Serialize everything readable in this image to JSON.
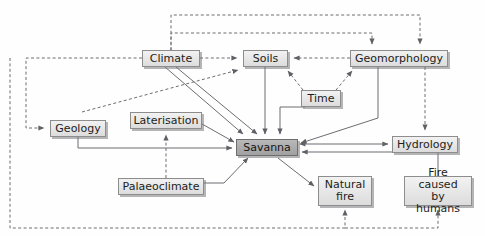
{
  "diagram": {
    "caption_sliver": "",
    "colors": {
      "node_fill": "#e6e6e6",
      "node_border": "#8d8d8d",
      "accent_fill": "#ababab",
      "accent_border": "#6e6e6e",
      "line": "#6d6d72",
      "text": "#1d1d20",
      "background": "#ffffff"
    },
    "nodes": [
      {
        "id": "climate",
        "label": "Climate",
        "x": 142,
        "y": 50,
        "w": 58,
        "h": 17,
        "accent": false
      },
      {
        "id": "soils",
        "label": "Soils",
        "x": 243,
        "y": 50,
        "w": 45,
        "h": 17,
        "accent": false
      },
      {
        "id": "geomorphology",
        "label": "Geomorphology",
        "x": 350,
        "y": 50,
        "w": 98,
        "h": 17,
        "accent": false
      },
      {
        "id": "time",
        "label": "Time",
        "x": 301,
        "y": 90,
        "w": 40,
        "h": 17,
        "accent": false
      },
      {
        "id": "geology",
        "label": "Geology",
        "x": 50,
        "y": 120,
        "w": 56,
        "h": 17,
        "accent": false
      },
      {
        "id": "laterisation",
        "label": "Laterisation",
        "x": 130,
        "y": 112,
        "w": 72,
        "h": 17,
        "accent": false
      },
      {
        "id": "savanna",
        "label": "Savanna",
        "x": 236,
        "y": 139,
        "w": 62,
        "h": 17,
        "accent": true
      },
      {
        "id": "hydrology",
        "label": "Hydrology",
        "x": 392,
        "y": 136,
        "w": 66,
        "h": 17,
        "accent": false
      },
      {
        "id": "palaeoclimate",
        "label": "Palaeoclimate",
        "x": 118,
        "y": 178,
        "w": 86,
        "h": 17,
        "accent": false
      },
      {
        "id": "naturalfire",
        "label": "Natural\nfire",
        "x": 318,
        "y": 176,
        "w": 54,
        "h": 30,
        "accent": false
      },
      {
        "id": "firehumans",
        "label": "Fire caused\nby humans",
        "x": 404,
        "y": 176,
        "w": 68,
        "h": 30,
        "accent": false
      }
    ],
    "edges": [
      {
        "from": "climate",
        "to": "soils",
        "style": "dashed",
        "arrow": "one"
      },
      {
        "from": "geology",
        "to": "soils",
        "style": "dashed",
        "arrow": "one"
      },
      {
        "from": "geomorphology",
        "to": "soils",
        "style": "dashed",
        "arrow": "one"
      },
      {
        "from": "time",
        "to": "soils",
        "style": "dashed",
        "arrow": "one"
      },
      {
        "from": "time",
        "to": "geomorphology",
        "style": "dashed",
        "arrow": "one"
      },
      {
        "from": "climate",
        "to": "geomorphology",
        "style": "dashed",
        "arrow": "one"
      },
      {
        "from": "geology",
        "to": "geomorphology",
        "style": "dashed",
        "arrow": "one"
      },
      {
        "from": "climate",
        "to": "geology",
        "style": "dashed",
        "arrow": "one"
      },
      {
        "from": "palaeoclimate",
        "to": "laterisation",
        "style": "dashed",
        "arrow": "one"
      },
      {
        "from": "naturalfire",
        "to": "naturalfire-in",
        "style": "dashed",
        "arrow": "one"
      },
      {
        "from": "firehumans",
        "to": "firehumans-in",
        "style": "dashed",
        "arrow": "one"
      },
      {
        "from": "climate",
        "to": "savanna",
        "style": "solid",
        "arrow": "one"
      },
      {
        "from": "soils",
        "to": "savanna",
        "style": "solid",
        "arrow": "one"
      },
      {
        "from": "time",
        "to": "savanna",
        "style": "solid",
        "arrow": "one"
      },
      {
        "from": "geomorphology",
        "to": "savanna",
        "style": "solid",
        "arrow": "one"
      },
      {
        "from": "geology",
        "to": "savanna",
        "style": "solid",
        "arrow": "one"
      },
      {
        "from": "laterisation",
        "to": "savanna",
        "style": "solid",
        "arrow": "one"
      },
      {
        "from": "palaeoclimate",
        "to": "savanna",
        "style": "solid",
        "arrow": "one"
      },
      {
        "from": "savanna",
        "to": "hydrology",
        "style": "solid",
        "arrow": "both"
      },
      {
        "from": "savanna",
        "to": "naturalfire",
        "style": "solid",
        "arrow": "one"
      },
      {
        "from": "firehumans",
        "to": "savanna",
        "style": "solid",
        "arrow": "one"
      },
      {
        "from": "geomorphology",
        "to": "hydrology",
        "style": "dashed",
        "arrow": "one"
      }
    ]
  }
}
